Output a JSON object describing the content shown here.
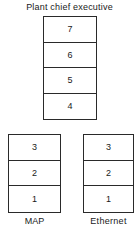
{
  "diagram": {
    "title": "Plant chief executive",
    "top_stack": {
      "layers": [
        "7",
        "6",
        "5",
        "4"
      ]
    },
    "bottom_stacks": [
      {
        "label": "MAP",
        "layers": [
          "3",
          "2",
          "1"
        ]
      },
      {
        "label": "Ethernet",
        "layers": [
          "3",
          "2",
          "1"
        ]
      }
    ]
  },
  "colors": {
    "line": "#2a2a2a",
    "text": "#1a1a1a",
    "background": "#ffffff"
  }
}
